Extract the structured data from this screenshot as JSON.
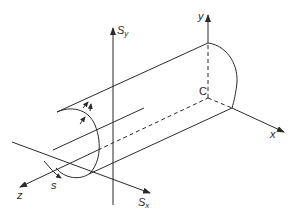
{
  "diagram": {
    "colors": {
      "stroke": "#2a2a2a",
      "background": "#ffffff"
    },
    "labels": {
      "y_axis": "y",
      "x_axis": "x",
      "z_axis": "z",
      "centroid": "C",
      "shear_y": {
        "base": "S",
        "sub": "y"
      },
      "shear_x": {
        "base": "S",
        "sub": "x"
      },
      "perimeter_coord": "s",
      "thickness": "t"
    }
  }
}
